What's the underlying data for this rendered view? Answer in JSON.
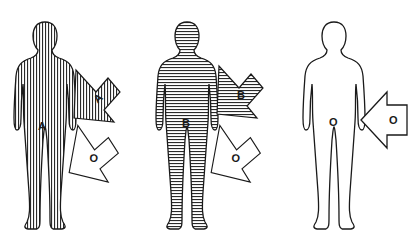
{
  "diagram": {
    "figures": [
      {
        "id": "figure-a",
        "fill_pattern": "vertical-stripes",
        "body_label": "A",
        "arrows": [
          {
            "label": "A",
            "fill": "vertical-stripes",
            "direction": "down-left"
          },
          {
            "label": "O",
            "fill": "none",
            "direction": "down-left"
          }
        ]
      },
      {
        "id": "figure-b",
        "fill_pattern": "horizontal-stripes",
        "body_label": "B",
        "arrows": [
          {
            "label": "B",
            "fill": "horizontal-stripes",
            "direction": "down-left"
          },
          {
            "label": "O",
            "fill": "none",
            "direction": "down-left"
          }
        ]
      },
      {
        "id": "figure-o",
        "fill_pattern": "none",
        "body_label": "O",
        "arrows": [
          {
            "label": "O",
            "fill": "none",
            "direction": "left"
          }
        ]
      }
    ],
    "colors": {
      "ink": "#1a1a1a",
      "background": "#ffffff"
    }
  }
}
